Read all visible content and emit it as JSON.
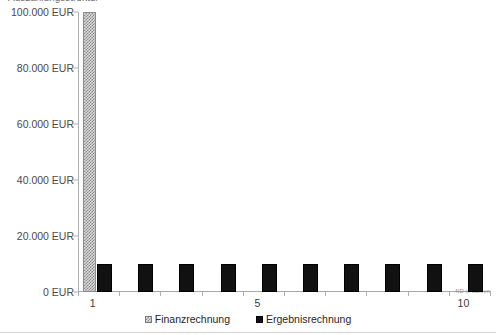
{
  "chart_data": {
    "type": "bar",
    "title": "Auszahlungsstruktur",
    "xlabel": "ND in Jahren",
    "ylabel": "",
    "categories": [
      "1",
      "2",
      "3",
      "4",
      "5",
      "6",
      "7",
      "8",
      "9",
      "10"
    ],
    "x_tick_labels_shown": [
      "1",
      "5",
      "10"
    ],
    "series": [
      {
        "name": "Finanzrechnung",
        "values": [
          100000,
          0,
          0,
          0,
          0,
          0,
          0,
          0,
          0,
          0
        ],
        "pattern": "checkered",
        "color": "#d9d9d9"
      },
      {
        "name": "Ergebnisrechnung",
        "values": [
          10000,
          10000,
          10000,
          10000,
          10000,
          10000,
          10000,
          10000,
          10000,
          10000
        ],
        "pattern": "solid",
        "color": "#111111"
      }
    ],
    "ylim": [
      0,
      100000
    ],
    "y_tick_values": [
      0,
      20000,
      40000,
      60000,
      80000,
      100000
    ],
    "y_tick_labels": [
      "0 EUR",
      "20.000 EUR",
      "40.000 EUR",
      "60.000 EUR",
      "80.000 EUR",
      "100.000 EUR"
    ],
    "grid": false,
    "legend_position": "bottom"
  },
  "legend": {
    "entries": [
      {
        "label": "Finanzrechnung",
        "marker": "checkered-swatch-icon"
      },
      {
        "label": "Ergebnisrechnung",
        "marker": "solid-swatch-icon"
      }
    ]
  },
  "axes": {
    "x_title": "ND in Jahren"
  }
}
